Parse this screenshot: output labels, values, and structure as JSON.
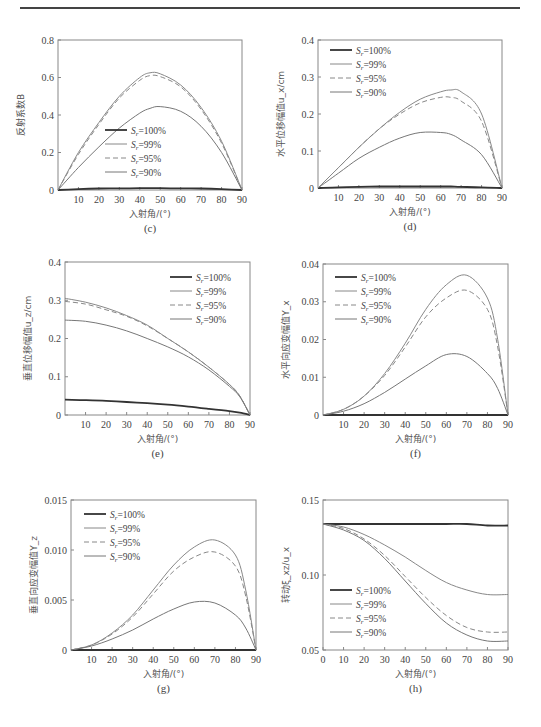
{
  "page": {
    "header_rule": true
  },
  "legend_entries": [
    "S_r=100%",
    "S_r=99%",
    "S_r=95%",
    "S_r=90%"
  ],
  "chart_data": [
    {
      "id": "c",
      "type": "line",
      "caption": "(c)",
      "title": "",
      "xlabel": "入射角/(°)",
      "ylabel": "反射系数B",
      "xlim": [
        0,
        90
      ],
      "ylim": [
        0,
        0.8
      ],
      "xticks": [
        10,
        20,
        30,
        40,
        50,
        60,
        70,
        80,
        90
      ],
      "yticks": [
        0,
        0.2,
        0.4,
        0.6,
        0.8
      ],
      "ytick_labels": [
        "0",
        "0.2",
        "0.4",
        "0.6",
        "0.8"
      ],
      "legend_position": "lower-center",
      "frame": {
        "x": 58,
        "y": 40,
        "w": 184,
        "h": 150
      },
      "legend_at": {
        "x": 105,
        "y": 130
      },
      "x": [
        0,
        10,
        20,
        30,
        40,
        45,
        50,
        60,
        70,
        80,
        90
      ],
      "series": [
        {
          "name": "S_r=100%",
          "values": [
            0,
            0.005,
            0.008,
            0.009,
            0.01,
            0.01,
            0.01,
            0.009,
            0.008,
            0.005,
            0
          ]
        },
        {
          "name": "S_r=99%",
          "values": [
            0,
            0.2,
            0.36,
            0.5,
            0.6,
            0.625,
            0.62,
            0.56,
            0.44,
            0.26,
            0
          ]
        },
        {
          "name": "S_r=95%",
          "values": [
            0,
            0.19,
            0.35,
            0.49,
            0.585,
            0.61,
            0.605,
            0.55,
            0.43,
            0.25,
            0
          ]
        },
        {
          "name": "S_r=90%",
          "values": [
            0,
            0.12,
            0.23,
            0.33,
            0.41,
            0.435,
            0.445,
            0.42,
            0.34,
            0.2,
            0
          ]
        }
      ]
    },
    {
      "id": "d",
      "type": "line",
      "caption": "(d)",
      "title": "",
      "xlabel": "入射角/(°)",
      "ylabel": "水平位移幅值u_x/cm",
      "xlim": [
        0,
        90
      ],
      "ylim": [
        0,
        0.4
      ],
      "xticks": [
        10,
        20,
        30,
        40,
        50,
        60,
        70,
        80,
        90
      ],
      "yticks": [
        0,
        0.1,
        0.2,
        0.3,
        0.4
      ],
      "ytick_labels": [
        "0",
        "0.1",
        "0.2",
        "0.3",
        "0.4"
      ],
      "legend_position": "upper-left",
      "frame": {
        "x": 318,
        "y": 40,
        "w": 184,
        "h": 148
      },
      "legend_at": {
        "x": 330,
        "y": 50
      },
      "x": [
        0,
        10,
        20,
        30,
        40,
        50,
        60,
        65,
        70,
        80,
        90
      ],
      "series": [
        {
          "name": "S_r=100%",
          "values": [
            0,
            0.002,
            0.003,
            0.004,
            0.004,
            0.004,
            0.004,
            0.004,
            0.003,
            0.002,
            0
          ]
        },
        {
          "name": "S_r=99%",
          "values": [
            0,
            0.055,
            0.11,
            0.16,
            0.205,
            0.24,
            0.26,
            0.265,
            0.26,
            0.2,
            0
          ]
        },
        {
          "name": "S_r=95%",
          "values": [
            0,
            0.055,
            0.11,
            0.16,
            0.2,
            0.23,
            0.245,
            0.245,
            0.235,
            0.18,
            0
          ]
        },
        {
          "name": "S_r=90%",
          "values": [
            0,
            0.04,
            0.08,
            0.11,
            0.135,
            0.15,
            0.15,
            0.145,
            0.13,
            0.09,
            0
          ]
        }
      ]
    },
    {
      "id": "e",
      "type": "line",
      "caption": "(e)",
      "title": "",
      "xlabel": "入射角/(°)",
      "ylabel": "垂直位移幅值u_z/cm",
      "xlim": [
        0,
        90
      ],
      "ylim": [
        0,
        0.4
      ],
      "xticks": [
        10,
        20,
        30,
        40,
        50,
        60,
        70,
        80,
        90
      ],
      "yticks": [
        0,
        0.1,
        0.2,
        0.3,
        0.4
      ],
      "ytick_labels": [
        "0",
        "0.1",
        "0.2",
        "0.3",
        "0.4"
      ],
      "legend_position": "upper-right",
      "frame": {
        "x": 65,
        "y": 262,
        "w": 185,
        "h": 153
      },
      "legend_at": {
        "x": 170,
        "y": 277
      },
      "x": [
        0,
        10,
        20,
        30,
        40,
        50,
        60,
        70,
        80,
        85,
        90
      ],
      "series": [
        {
          "name": "S_r=100%",
          "values": [
            0.04,
            0.039,
            0.037,
            0.034,
            0.031,
            0.027,
            0.022,
            0.016,
            0.01,
            0.006,
            0
          ]
        },
        {
          "name": "S_r=99%",
          "values": [
            0.305,
            0.295,
            0.28,
            0.26,
            0.235,
            0.2,
            0.165,
            0.125,
            0.08,
            0.05,
            0
          ]
        },
        {
          "name": "S_r=95%",
          "values": [
            0.297,
            0.29,
            0.275,
            0.258,
            0.233,
            0.2,
            0.165,
            0.125,
            0.08,
            0.05,
            0
          ]
        },
        {
          "name": "S_r=90%",
          "values": [
            0.248,
            0.245,
            0.235,
            0.22,
            0.2,
            0.178,
            0.152,
            0.118,
            0.075,
            0.048,
            0
          ]
        }
      ]
    },
    {
      "id": "f",
      "type": "line",
      "caption": "(f)",
      "title": "",
      "xlabel": "入射角/(°)",
      "ylabel": "水平向应变幅值Y_x",
      "xlim": [
        0,
        90
      ],
      "ylim": [
        0,
        0.04
      ],
      "xticks": [
        10,
        20,
        30,
        40,
        50,
        60,
        70,
        80,
        90
      ],
      "yticks": [
        0,
        0.01,
        0.02,
        0.03,
        0.04
      ],
      "ytick_labels": [
        "0",
        "0.01",
        "0.02",
        "0.03",
        "0.04"
      ],
      "legend_position": "upper-left",
      "frame": {
        "x": 323,
        "y": 264,
        "w": 185,
        "h": 151
      },
      "legend_at": {
        "x": 335,
        "y": 277
      },
      "x": [
        0,
        10,
        20,
        30,
        40,
        50,
        60,
        70,
        80,
        85,
        90
      ],
      "series": [
        {
          "name": "S_r=100%",
          "values": [
            0,
            0,
            0,
            0,
            0,
            0,
            0,
            0,
            0,
            0,
            0
          ]
        },
        {
          "name": "S_r=99%",
          "values": [
            0,
            0.0015,
            0.005,
            0.011,
            0.019,
            0.028,
            0.0345,
            0.037,
            0.031,
            0.02,
            0
          ]
        },
        {
          "name": "S_r=95%",
          "values": [
            0,
            0.0015,
            0.005,
            0.0105,
            0.018,
            0.026,
            0.031,
            0.033,
            0.028,
            0.018,
            0
          ]
        },
        {
          "name": "S_r=90%",
          "values": [
            0,
            0.001,
            0.003,
            0.006,
            0.0095,
            0.013,
            0.016,
            0.0155,
            0.011,
            0.007,
            0
          ]
        }
      ]
    },
    {
      "id": "g",
      "type": "line",
      "caption": "(g)",
      "title": "",
      "xlabel": "入射角/(°)",
      "ylabel": "垂直向应变幅值Y_z",
      "xlim": [
        0,
        90
      ],
      "ylim": [
        0,
        0.015
      ],
      "xticks": [
        10,
        20,
        30,
        40,
        50,
        60,
        70,
        80,
        90
      ],
      "yticks": [
        0,
        0.005,
        0.01,
        0.015
      ],
      "ytick_labels": [
        "0",
        "0.005",
        "0.010",
        "0.015"
      ],
      "legend_position": "upper-left",
      "frame": {
        "x": 71,
        "y": 500,
        "w": 185,
        "h": 150
      },
      "legend_at": {
        "x": 84,
        "y": 514
      },
      "x": [
        0,
        10,
        20,
        30,
        40,
        50,
        60,
        70,
        80,
        85,
        90
      ],
      "series": [
        {
          "name": "S_r=100%",
          "values": [
            0,
            0,
            0,
            0,
            0,
            0,
            0,
            0,
            0,
            0,
            0
          ]
        },
        {
          "name": "S_r=99%",
          "values": [
            0,
            0.0005,
            0.0017,
            0.0035,
            0.006,
            0.0085,
            0.0103,
            0.011,
            0.0095,
            0.006,
            0
          ]
        },
        {
          "name": "S_r=95%",
          "values": [
            0,
            0.0005,
            0.0016,
            0.0033,
            0.0056,
            0.0079,
            0.0093,
            0.0098,
            0.0084,
            0.0054,
            0
          ]
        },
        {
          "name": "S_r=90%",
          "values": [
            0,
            0.0004,
            0.0011,
            0.002,
            0.0031,
            0.0041,
            0.0048,
            0.0047,
            0.0035,
            0.0022,
            0
          ]
        }
      ]
    },
    {
      "id": "h",
      "type": "line",
      "caption": "(h)",
      "title": "",
      "xlabel": "入射角/(°)",
      "ylabel": "转动ξ_xz/u_x",
      "xlim": [
        0,
        90
      ],
      "ylim": [
        0.05,
        0.15
      ],
      "xticks": [
        0,
        10,
        20,
        30,
        40,
        50,
        60,
        70,
        80,
        90
      ],
      "yticks": [
        0.05,
        0.1,
        0.15
      ],
      "ytick_labels": [
        "0.05",
        "0.10",
        "0.15"
      ],
      "legend_position": "lower-left",
      "frame": {
        "x": 323,
        "y": 500,
        "w": 185,
        "h": 150
      },
      "legend_at": {
        "x": 330,
        "y": 590
      },
      "x": [
        0,
        10,
        20,
        30,
        40,
        50,
        60,
        70,
        80,
        90
      ],
      "series": [
        {
          "name": "S_r=100%",
          "values": [
            0.134,
            0.134,
            0.134,
            0.134,
            0.134,
            0.134,
            0.134,
            0.134,
            0.133,
            0.133
          ]
        },
        {
          "name": "S_r=99%",
          "values": [
            0.134,
            0.132,
            0.127,
            0.12,
            0.112,
            0.103,
            0.095,
            0.09,
            0.087,
            0.087
          ]
        },
        {
          "name": "S_r=95%",
          "values": [
            0.134,
            0.131,
            0.124,
            0.113,
            0.099,
            0.085,
            0.073,
            0.065,
            0.062,
            0.062
          ]
        },
        {
          "name": "S_r=90%",
          "values": [
            0.134,
            0.13,
            0.123,
            0.111,
            0.096,
            0.081,
            0.068,
            0.06,
            0.056,
            0.056
          ]
        }
      ]
    }
  ],
  "styles": {
    "series": [
      {
        "color": "#333333",
        "width": 1.8,
        "dash": ""
      },
      {
        "color": "#888888",
        "width": 1.0,
        "dash": ""
      },
      {
        "color": "#888888",
        "width": 1.0,
        "dash": "5,3"
      },
      {
        "color": "#777777",
        "width": 1.0,
        "dash": ""
      }
    ],
    "frame_color": "#888888"
  }
}
